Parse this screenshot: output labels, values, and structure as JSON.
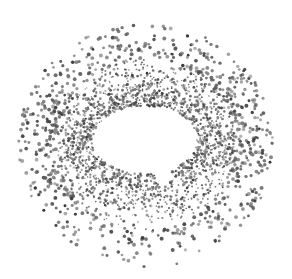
{
  "illustration": {
    "subject": "speech-bubble-negative-space",
    "background_color": "#ffffff",
    "dot_color": "#4a4a4a",
    "center": [
      146,
      145
    ],
    "outer_radius": [
      118,
      118
    ],
    "hole": {
      "center": [
        145,
        140
      ],
      "radius": [
        52,
        34
      ],
      "tail": [
        [
          150,
          165
        ],
        [
          162,
          191
        ],
        [
          175,
          166
        ]
      ]
    },
    "dot_count": 2600,
    "seed": 7
  }
}
